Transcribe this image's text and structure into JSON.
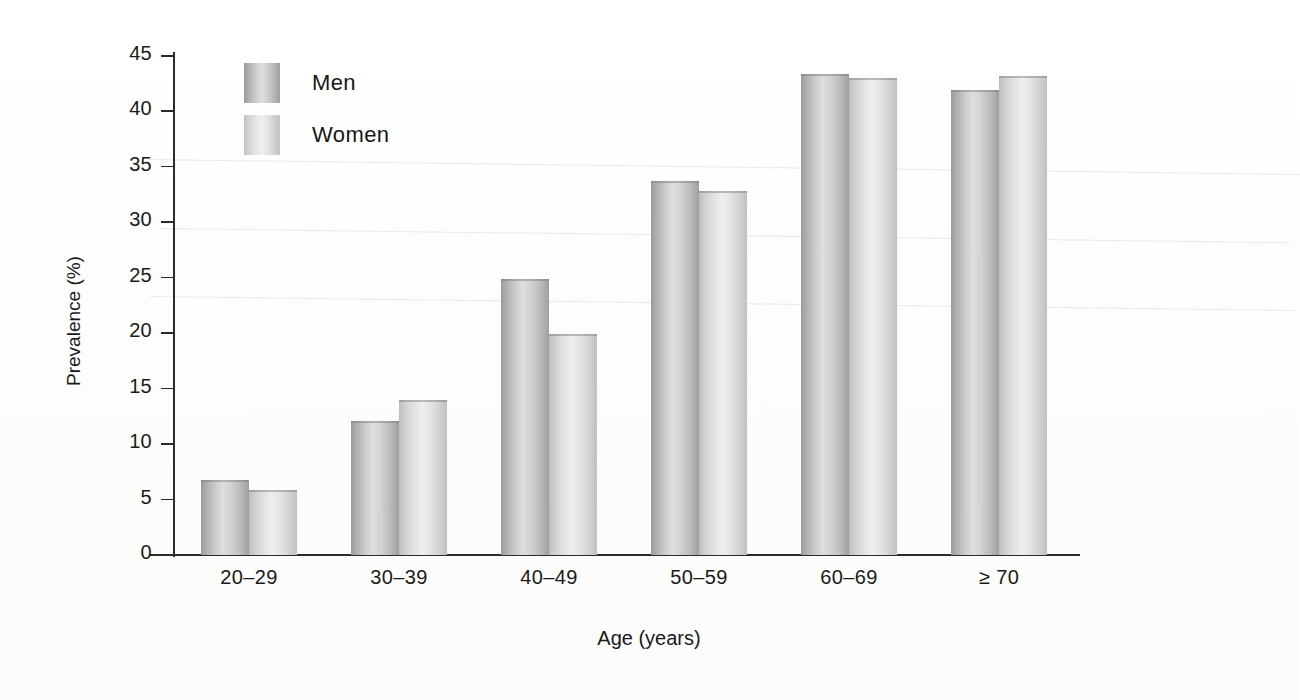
{
  "chart_data": {
    "type": "bar",
    "title": "",
    "xlabel": "Age (years)",
    "ylabel": "Prevalence (%)",
    "categories": [
      "20–29",
      "30–39",
      "40–49",
      "50–59",
      "60–69",
      "≥ 70"
    ],
    "series": [
      {
        "name": "Men",
        "values": [
          6.8,
          12.1,
          24.9,
          33.7,
          43.4,
          41.9
        ],
        "color": "#c2c2c2"
      },
      {
        "name": "Women",
        "values": [
          5.9,
          14.0,
          19.9,
          32.8,
          43.0,
          43.2
        ],
        "color": "#e2e2e2"
      }
    ],
    "ylim": [
      0,
      45
    ],
    "yticks": [
      0,
      5,
      10,
      15,
      20,
      25,
      30,
      35,
      40,
      45
    ],
    "ytick_labels": [
      "0",
      "5",
      "10",
      "15",
      "20",
      "25",
      "30",
      "35",
      "40",
      "45"
    ],
    "grid": false,
    "legend_position": "top-left",
    "bar_style": "cylindrical-gradient"
  },
  "axes": {
    "y_title": "Prevalence (%)",
    "x_title": "Age (years)"
  },
  "legend": {
    "entries": [
      {
        "label": "Men",
        "swatch": "men"
      },
      {
        "label": "Women",
        "swatch": "women"
      }
    ]
  }
}
